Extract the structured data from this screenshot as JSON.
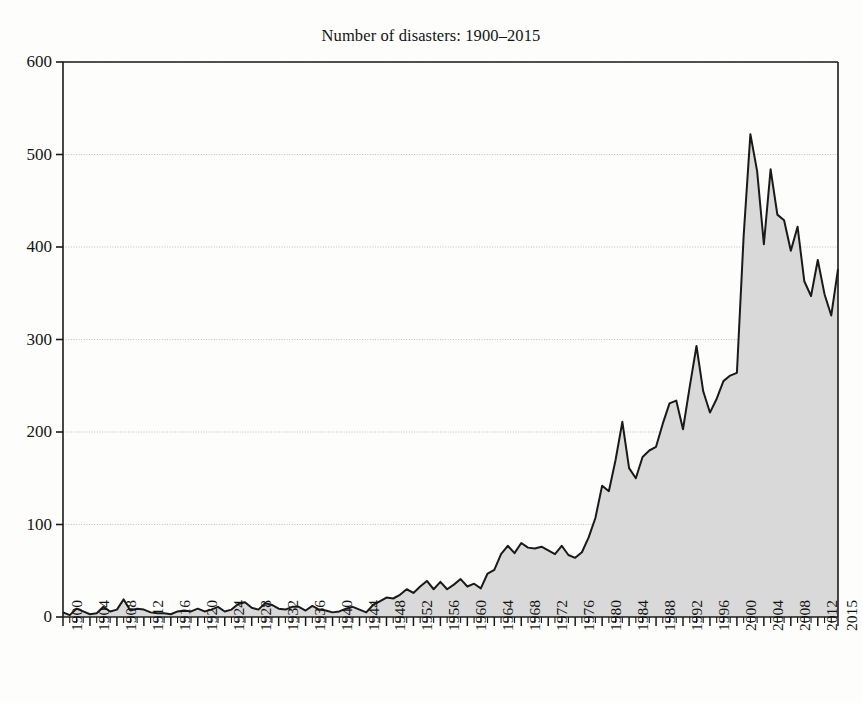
{
  "chart_data": {
    "type": "area",
    "title": "Number of disasters: 1900–2015",
    "xlabel": "",
    "ylabel": "",
    "ylim": [
      0,
      600
    ],
    "xlim": [
      1900,
      2015
    ],
    "yticks": [
      0,
      100,
      200,
      300,
      400,
      500,
      600
    ],
    "ytick_labels": [
      "0",
      "100",
      "200",
      "300",
      "400",
      "500",
      "600"
    ],
    "xtick_labels": [
      "1900",
      "1904",
      "1908",
      "1912",
      "1916",
      "1920",
      "1924",
      "1928",
      "1932",
      "1936",
      "1940",
      "1944",
      "1948",
      "1952",
      "1956",
      "1960",
      "1964",
      "1968",
      "1972",
      "1976",
      "1980",
      "1984",
      "1988",
      "1992",
      "1996",
      "2000",
      "2004",
      "2008",
      "2012",
      "2015"
    ],
    "xtick_values": [
      1900,
      1904,
      1908,
      1912,
      1916,
      1920,
      1924,
      1928,
      1932,
      1936,
      1940,
      1944,
      1948,
      1952,
      1956,
      1960,
      1964,
      1968,
      1972,
      1976,
      1980,
      1984,
      1988,
      1992,
      1996,
      2000,
      2004,
      2008,
      2012,
      2015
    ],
    "minor_xticks_every": 1,
    "grid": "horizontal-dotted",
    "legend": "none",
    "fill_color": "#d9d9d9",
    "line_color": "#1a1a1a",
    "grid_color": "#b8b8b8",
    "axis_color": "#1a1a1a",
    "background_color": "#fdfdfb",
    "x": [
      1900,
      1901,
      1902,
      1903,
      1904,
      1905,
      1906,
      1907,
      1908,
      1909,
      1910,
      1911,
      1912,
      1913,
      1914,
      1915,
      1916,
      1917,
      1918,
      1919,
      1920,
      1921,
      1922,
      1923,
      1924,
      1925,
      1926,
      1927,
      1928,
      1929,
      1930,
      1931,
      1932,
      1933,
      1934,
      1935,
      1936,
      1937,
      1938,
      1939,
      1940,
      1941,
      1942,
      1943,
      1944,
      1945,
      1946,
      1947,
      1948,
      1949,
      1950,
      1951,
      1952,
      1953,
      1954,
      1955,
      1956,
      1957,
      1958,
      1959,
      1960,
      1961,
      1962,
      1963,
      1964,
      1965,
      1966,
      1967,
      1968,
      1969,
      1970,
      1971,
      1972,
      1973,
      1974,
      1975,
      1976,
      1977,
      1978,
      1979,
      1980,
      1981,
      1982,
      1983,
      1984,
      1985,
      1986,
      1987,
      1988,
      1989,
      1990,
      1991,
      1992,
      1993,
      1994,
      1995,
      1996,
      1997,
      1998,
      1999,
      2000,
      2001,
      2002,
      2003,
      2004,
      2005,
      2006,
      2007,
      2008,
      2009,
      2010,
      2011,
      2012,
      2013,
      2014,
      2015
    ],
    "values": [
      5,
      2,
      9,
      6,
      3,
      4,
      11,
      6,
      8,
      19,
      7,
      9,
      8,
      5,
      4,
      4,
      3,
      6,
      7,
      6,
      9,
      6,
      8,
      11,
      6,
      8,
      14,
      16,
      10,
      8,
      15,
      13,
      9,
      8,
      11,
      11,
      7,
      12,
      8,
      7,
      5,
      6,
      9,
      11,
      8,
      5,
      13,
      17,
      21,
      20,
      24,
      30,
      26,
      33,
      39,
      30,
      38,
      30,
      35,
      41,
      33,
      36,
      31,
      47,
      51,
      68,
      77,
      69,
      80,
      75,
      74,
      76,
      72,
      68,
      77,
      67,
      64,
      70,
      86,
      107,
      142,
      136,
      170,
      211,
      161,
      150,
      173,
      180,
      184,
      209,
      231,
      234,
      203,
      249,
      293,
      244,
      221,
      236,
      255,
      261,
      264,
      412,
      522,
      482,
      403,
      484,
      435,
      429,
      396,
      422,
      363,
      347,
      386,
      349,
      326,
      376
    ]
  }
}
